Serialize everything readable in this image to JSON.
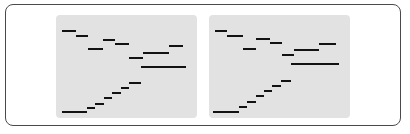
{
  "figure": {
    "background_color": "#ffffff",
    "frame_color": "#4a4a4a",
    "panel_color": "#e2e2e2",
    "series_color": "#121212",
    "panel_count": 2
  },
  "chart_data": [
    {
      "type": "line",
      "title": "",
      "xlabel": "",
      "ylabel": "",
      "subtitle": "",
      "grid": false,
      "legend": "none",
      "xlim": [
        0,
        100
      ],
      "ylim": [
        0,
        100
      ],
      "drawstyle": "steps-post",
      "panel_index": 0,
      "panel_name": "left-panel",
      "series": [
        {
          "name": "upper-descending-step",
          "points": [
            {
              "x": 4,
              "y": 84
            },
            {
              "x": 14,
              "y": 80
            },
            {
              "x": 23,
              "y": 67
            },
            {
              "x": 33,
              "y": 76
            },
            {
              "x": 42,
              "y": 72
            },
            {
              "x": 52,
              "y": 58
            },
            {
              "x": 62,
              "y": 63
            },
            {
              "x": 72,
              "y": 63
            },
            {
              "x": 80,
              "y": 70
            },
            {
              "x": 90,
              "y": 70
            }
          ]
        },
        {
          "name": "lower-ascending-step",
          "points": [
            {
              "x": 4,
              "y": 6
            },
            {
              "x": 14,
              "y": 6
            },
            {
              "x": 22,
              "y": 10
            },
            {
              "x": 28,
              "y": 14
            },
            {
              "x": 34,
              "y": 19
            },
            {
              "x": 40,
              "y": 24
            },
            {
              "x": 46,
              "y": 29
            },
            {
              "x": 52,
              "y": 34
            },
            {
              "x": 60,
              "y": 50
            },
            {
              "x": 75,
              "y": 50
            },
            {
              "x": 92,
              "y": 50
            }
          ]
        }
      ]
    },
    {
      "type": "line",
      "title": "",
      "xlabel": "",
      "ylabel": "",
      "subtitle": "",
      "grid": false,
      "legend": "none",
      "xlim": [
        0,
        100
      ],
      "ylim": [
        0,
        100
      ],
      "drawstyle": "steps-post",
      "panel_index": 1,
      "panel_name": "right-panel",
      "series": [
        {
          "name": "upper-descending-step",
          "points": [
            {
              "x": 4,
              "y": 84
            },
            {
              "x": 13,
              "y": 80
            },
            {
              "x": 24,
              "y": 67
            },
            {
              "x": 33,
              "y": 77
            },
            {
              "x": 43,
              "y": 73
            },
            {
              "x": 52,
              "y": 61
            },
            {
              "x": 60,
              "y": 66
            },
            {
              "x": 72,
              "y": 66
            },
            {
              "x": 78,
              "y": 72
            },
            {
              "x": 90,
              "y": 72
            }
          ]
        },
        {
          "name": "lower-ascending-step",
          "points": [
            {
              "x": 3,
              "y": 6
            },
            {
              "x": 13,
              "y": 6
            },
            {
              "x": 21,
              "y": 11
            },
            {
              "x": 27,
              "y": 16
            },
            {
              "x": 33,
              "y": 21
            },
            {
              "x": 39,
              "y": 26
            },
            {
              "x": 45,
              "y": 31
            },
            {
              "x": 51,
              "y": 36
            },
            {
              "x": 58,
              "y": 52
            },
            {
              "x": 75,
              "y": 52
            },
            {
              "x": 92,
              "y": 52
            }
          ]
        }
      ]
    }
  ]
}
